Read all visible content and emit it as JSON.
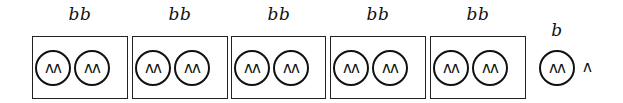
{
  "groups": [
    {
      "label": "bb",
      "circles": [
        "^^",
        "^^"
      ]
    },
    {
      "label": "bb",
      "circles": [
        "^^",
        "^^"
      ]
    },
    {
      "label": "bb",
      "circles": [
        "^^",
        "^^"
      ]
    },
    {
      "label": "bb",
      "circles": [
        "^^",
        "^^"
      ]
    },
    {
      "label": "bb",
      "circles": [
        "^^",
        "^^"
      ]
    }
  ],
  "remainder": {
    "label": "b",
    "circle": "^^",
    "trailing": "^"
  },
  "glyphs": {
    "circle_content": "ʌʌ",
    "caret": "ʌ"
  }
}
